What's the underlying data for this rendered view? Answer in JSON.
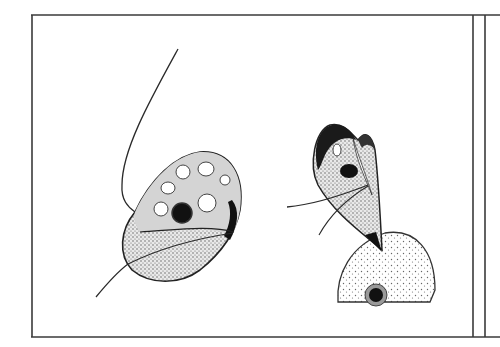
{
  "figure": {
    "colors": {
      "background": "#ffffff",
      "ink": "#2a2a2a",
      "frame": "#3a3a3a",
      "nucleus": "#111111",
      "stipple": "#555555"
    },
    "panels": [
      {
        "name": "left-organism",
        "shape": "ovoid cell with vacuoles, dark nucleus, long anterior flagellum and trailing flagellum"
      },
      {
        "name": "right-organism",
        "shape": "pear-shaped cell with dark nucleus attached by a pointed tip to a round stippled cell containing a nucleus"
      }
    ]
  }
}
